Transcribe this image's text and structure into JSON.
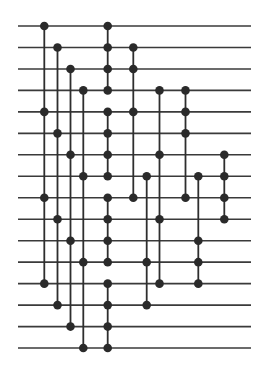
{
  "diagram": {
    "type": "comparator-network",
    "wire_count": 16,
    "wire_x_start": 18,
    "wire_x_end": 251,
    "wire_y_first": 26,
    "wire_y_spacing": 21.47,
    "node_radius": 4.3,
    "colors": {
      "wire": "#3a3a3a",
      "connector": "#2e2e2e",
      "node": "#2a2a2a",
      "background": "#ffffff"
    },
    "columns": [
      {
        "x": 44.3,
        "wires": [
          1,
          5,
          9,
          13
        ]
      },
      {
        "x": 57.5,
        "wires": [
          2,
          6,
          10,
          14
        ]
      },
      {
        "x": 70.5,
        "wires": [
          3,
          7,
          11,
          15
        ]
      },
      {
        "x": 83.3,
        "wires": [
          4,
          8,
          12,
          16
        ]
      },
      {
        "x": 107.7,
        "wires": [
          1,
          2,
          3,
          4
        ]
      },
      {
        "x": 107.7,
        "wires": [
          5,
          6,
          7,
          8
        ]
      },
      {
        "x": 107.7,
        "wires": [
          9,
          10,
          11,
          12
        ]
      },
      {
        "x": 107.7,
        "wires": [
          13,
          14,
          15,
          16
        ]
      },
      {
        "x": 133.3,
        "wires": [
          2,
          3,
          5,
          9
        ]
      },
      {
        "x": 146.7,
        "wires": [
          8,
          12,
          14
        ]
      },
      {
        "x": 159.5,
        "wires": [
          4,
          7,
          10,
          13
        ]
      },
      {
        "x": 185.5,
        "wires": [
          4,
          5,
          6,
          9
        ]
      },
      {
        "x": 198.3,
        "wires": [
          8,
          11,
          12,
          13
        ]
      },
      {
        "x": 224.3,
        "wires": [
          7,
          8,
          9,
          10
        ]
      }
    ]
  }
}
